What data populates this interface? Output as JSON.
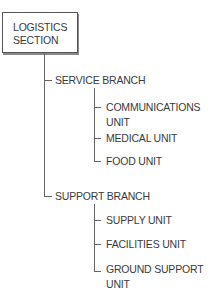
{
  "diagram": {
    "type": "org-tree",
    "root": {
      "label_line1": "LOGISTICS",
      "label_line2": "SECTION"
    },
    "branches": [
      {
        "label": "SERVICE BRANCH",
        "units": [
          {
            "line1": "COMMUNICATIONS",
            "line2": "UNIT"
          },
          {
            "line1": "MEDICAL UNIT"
          },
          {
            "line1": "FOOD UNIT"
          }
        ]
      },
      {
        "label": "SUPPORT BRANCH",
        "units": [
          {
            "line1": "SUPPLY UNIT"
          },
          {
            "line1": "FACILITIES UNIT"
          },
          {
            "line1": "GROUND SUPPORT",
            "line2": "UNIT"
          }
        ]
      }
    ],
    "colors": {
      "line": "#666666",
      "text": "#3a3a3a",
      "box_border": "#555555"
    }
  }
}
